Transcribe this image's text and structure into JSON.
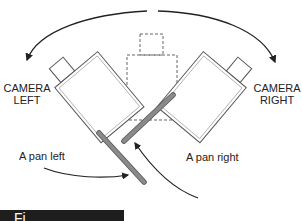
{
  "diagram": {
    "labels": {
      "camera_left_line1": "CAMERA",
      "camera_left_line2": "LEFT",
      "camera_right_line1": "CAMERA",
      "camera_right_line2": "RIGHT",
      "pan_left": "A pan left",
      "pan_right": "A pan right"
    },
    "caption": {
      "text": "Fi"
    },
    "colors": {
      "line": "#222222",
      "camera_outline": "#555555",
      "handle_fill": "#8a8a8a",
      "dashed": "#666666",
      "caption_bg": "#1e1e1e"
    },
    "elements": [
      "left-arc-arrow",
      "right-arc-arrow",
      "camera-left",
      "camera-center-dashed",
      "camera-right",
      "pan-handle-left",
      "pan-handle-right",
      "pan-left-arrow",
      "pan-right-arrow"
    ]
  }
}
